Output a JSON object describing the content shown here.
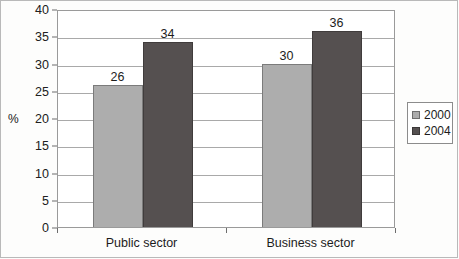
{
  "chart_data": {
    "type": "bar",
    "title": "",
    "subtitle": "",
    "xlabel": "",
    "ylabel": "%",
    "ylim": [
      0,
      40
    ],
    "ytick_step": 5,
    "yticks": [
      "40",
      "35",
      "30",
      "25",
      "20",
      "15",
      "10",
      "5",
      "0"
    ],
    "grid": true,
    "legend_position": "right",
    "categories": [
      "Public sector",
      "Business sector"
    ],
    "series": [
      {
        "name": "2000",
        "color": "#adadad",
        "values": [
          26,
          30
        ],
        "labels": [
          "26",
          "30"
        ]
      },
      {
        "name": "2004",
        "color": "#555050",
        "values": [
          34,
          36
        ],
        "labels": [
          "34",
          "36"
        ]
      }
    ]
  },
  "legend": {
    "entries": [
      {
        "label": "2000"
      },
      {
        "label": "2004"
      }
    ]
  },
  "axis": {
    "y_title": "%"
  }
}
